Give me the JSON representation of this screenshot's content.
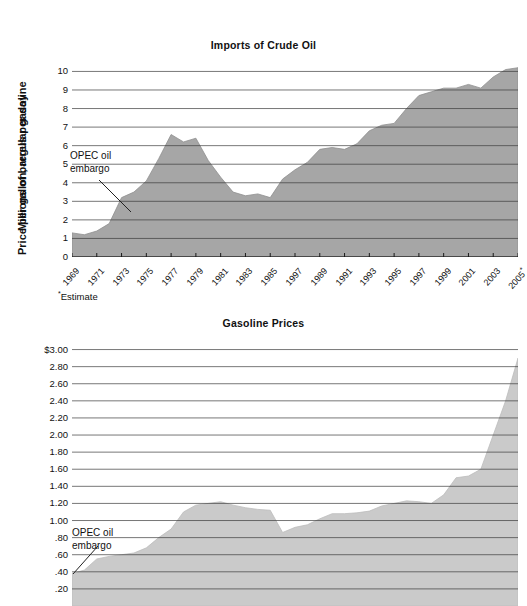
{
  "charts": [
    {
      "id": "imports",
      "title": "Imports of Crude Oil",
      "ylabel": "Millions of barrels per day",
      "annotation_line1": "OPEC oil",
      "annotation_line2": "embargo",
      "footnote_star": "*",
      "footnote_text": "Estimate",
      "fill_color": "#a6a6a6",
      "line_color": "#8f8f8f",
      "grid_color": "#3c3c3c"
    },
    {
      "id": "gasoline",
      "title": "Gasoline Prices",
      "ylabel": "Price per gallon, regular gasoline",
      "annotation_line1": "OPEC oil",
      "annotation_line2": "embargo",
      "fill_color": "#cacaca",
      "line_color": "#bdbdbd",
      "grid_color": "#3c3c3c"
    }
  ],
  "chart_data": [
    {
      "type": "area",
      "title": "Imports of Crude Oil",
      "xlabel": "",
      "ylabel": "Millions of barrels per day",
      "ylim": [
        0,
        10.4
      ],
      "yticks": [
        0,
        1,
        2,
        3,
        4,
        5,
        6,
        7,
        8,
        9,
        10
      ],
      "ytick_labels": [
        "0",
        "1",
        "2",
        "3",
        "4",
        "5",
        "6",
        "7",
        "8",
        "9",
        "10"
      ],
      "grid": true,
      "legend": "none",
      "annotations": [
        {
          "text": "OPEC oil embargo",
          "points_to_year": 1973,
          "points_to_value": 3.2
        },
        {
          "text": "*Estimate",
          "note": "asterisk on 2005 tick label"
        }
      ],
      "xtick_labels": [
        "1969",
        "1971",
        "1973",
        "1975",
        "1977",
        "1979",
        "1981",
        "1983",
        "1985",
        "1997",
        "1989",
        "1991",
        "1993",
        "1995",
        "1997",
        "1999",
        "2001",
        "2003",
        "2005*"
      ],
      "x": [
        1969,
        1970,
        1971,
        1972,
        1973,
        1974,
        1975,
        1976,
        1977,
        1978,
        1979,
        1980,
        1981,
        1982,
        1983,
        1984,
        1985,
        1986,
        1987,
        1988,
        1989,
        1990,
        1991,
        1992,
        1993,
        1994,
        1995,
        1996,
        1997,
        1998,
        1999,
        2000,
        2001,
        2002,
        2003,
        2004,
        2005
      ],
      "values": [
        1.3,
        1.2,
        1.4,
        1.8,
        3.2,
        3.5,
        4.1,
        5.3,
        6.6,
        6.2,
        6.4,
        5.2,
        4.3,
        3.5,
        3.3,
        3.4,
        3.2,
        4.2,
        4.7,
        5.1,
        5.8,
        5.9,
        5.8,
        6.1,
        6.8,
        7.1,
        7.2,
        8.0,
        8.7,
        8.9,
        9.1,
        9.1,
        9.3,
        9.1,
        9.7,
        10.1,
        10.2
      ]
    },
    {
      "type": "area",
      "title": "Gasoline Prices",
      "xlabel": "",
      "ylabel": "Price per gallon, regular gasoline",
      "ylim": [
        0,
        3.1
      ],
      "yticks": [
        0.2,
        0.4,
        0.6,
        0.8,
        1.0,
        1.2,
        1.4,
        1.6,
        1.8,
        2.0,
        2.2,
        2.4,
        2.6,
        2.8,
        3.0
      ],
      "ytick_labels": [
        ".20",
        ".40",
        ".60",
        ".80",
        "1.00",
        "1.20",
        "1.40",
        "1.60",
        "1.80",
        "2.00",
        "2.20",
        "2.40",
        "2.60",
        "2.80",
        "$3.00"
      ],
      "grid": true,
      "legend": "none",
      "annotations": [
        {
          "text": "OPEC oil embargo",
          "points_to_year": 1969,
          "points_to_value": 0.4
        }
      ],
      "x": [
        1969,
        1970,
        1971,
        1972,
        1973,
        1974,
        1975,
        1976,
        1977,
        1978,
        1979,
        1980,
        1981,
        1982,
        1983,
        1984,
        1985,
        1986,
        1987,
        1988,
        1989,
        1990,
        1991,
        1992,
        1993,
        1994,
        1995,
        1996,
        1997,
        1998,
        1999,
        2000,
        2001,
        2002,
        2003,
        2004,
        2005
      ],
      "values": [
        0.38,
        0.42,
        0.55,
        0.58,
        0.6,
        0.62,
        0.68,
        0.8,
        0.9,
        1.1,
        1.18,
        1.2,
        1.22,
        1.18,
        1.15,
        1.13,
        1.12,
        0.86,
        0.92,
        0.95,
        1.02,
        1.08,
        1.08,
        1.09,
        1.11,
        1.17,
        1.2,
        1.23,
        1.22,
        1.2,
        1.3,
        1.5,
        1.52,
        1.6,
        2.0,
        2.4,
        2.9
      ]
    }
  ]
}
